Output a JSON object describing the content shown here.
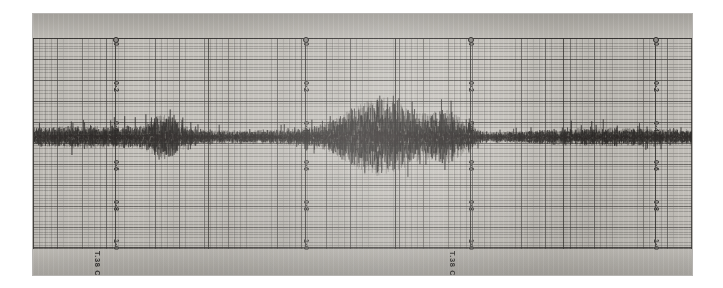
{
  "document": {
    "type": "seismogram-chart-photograph",
    "caption": "Photographic seismogram strip with ruled recording paper"
  },
  "paper": {
    "background_color": "#bdbab4",
    "grid_color": "#46423f",
    "trace_color": "#2b2826"
  },
  "sections": [
    {
      "id": "section-1",
      "zero_marker": "o",
      "trace_tag": "T.38 C",
      "scale_labels": [
        "0",
        "0·2",
        "0·4",
        "0·6",
        "0·8",
        "1·0"
      ]
    },
    {
      "id": "section-2",
      "zero_marker": "o",
      "trace_tag": "",
      "scale_labels": [
        "0",
        "0·2",
        "0·4",
        "0·6",
        "0·8",
        "1·0"
      ]
    },
    {
      "id": "section-3",
      "zero_marker": "o",
      "trace_tag": "T.38 C",
      "scale_labels": [
        "0",
        "0·2",
        "0·4",
        "0·6",
        "0·8",
        "1·0"
      ]
    },
    {
      "id": "section-4",
      "zero_marker": "o",
      "trace_tag": "",
      "scale_labels": [
        "0",
        "0·2",
        "0·4",
        "0·6",
        "0·8",
        "1·0"
      ]
    }
  ],
  "chart_data": {
    "type": "line",
    "title": "",
    "subtitle": "",
    "xlabel": "",
    "ylabel": "",
    "grid": true,
    "legend": false,
    "axis_orientation": "scale-labels-rotated-90deg",
    "scale_tick_labels": [
      "0",
      "0·2",
      "0·4",
      "0·6",
      "0·8",
      "1·0"
    ],
    "scale_tick_count": 6,
    "repeated_scale_blocks": 4,
    "baseline_value": 0.47,
    "ylim": [
      0,
      1.0
    ],
    "xlim": [
      0,
      1
    ],
    "annotations": [
      "T.38 C",
      "T.38 C"
    ],
    "series": [
      {
        "name": "seismic-trace",
        "description": "Continuous background microseism noise with one large central event burst and a secondary smaller burst",
        "baseline": 0.47,
        "background_amplitude": 0.035,
        "events": [
          {
            "name": "main-event",
            "center_x": 0.53,
            "width": 0.12,
            "peak_amplitude": 0.125
          },
          {
            "name": "secondary-event",
            "center_x": 0.63,
            "width": 0.06,
            "peak_amplitude": 0.07
          },
          {
            "name": "minor-event",
            "center_x": 0.2,
            "width": 0.05,
            "peak_amplitude": 0.05
          }
        ]
      }
    ]
  }
}
